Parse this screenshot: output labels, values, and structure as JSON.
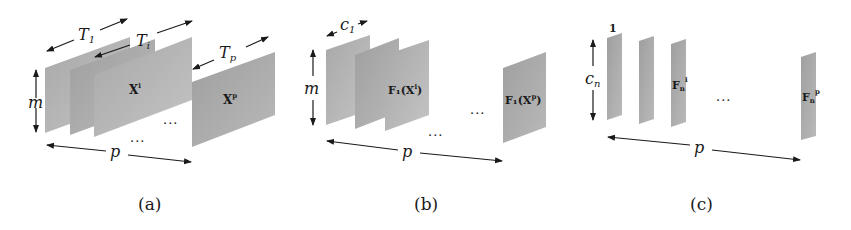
{
  "figure": {
    "panels": [
      {
        "id": "a",
        "caption": "(a)",
        "plates": [
          {
            "label": ""
          },
          {
            "label": ""
          },
          {
            "label": "X",
            "sup": "i"
          },
          {
            "label": "X",
            "sup": "p"
          }
        ],
        "dims": {
          "height": "m",
          "width": "p",
          "widths": [
            {
              "main": "T",
              "sub": "1"
            },
            {
              "main": "T",
              "sub": "i"
            },
            {
              "main": "T",
              "sub": "p"
            }
          ]
        },
        "ellipsis": [
          "...",
          "..."
        ]
      },
      {
        "id": "b",
        "caption": "(b)",
        "plates": [
          {
            "label": ""
          },
          {
            "label": ""
          },
          {
            "label": "F₁(X",
            "sup": "i",
            "close": ")"
          },
          {
            "label": "F₁(X",
            "sup": "p",
            "close": ")"
          }
        ],
        "dims": {
          "height": "m",
          "width": "p",
          "plate_width": {
            "main": "c",
            "sub": "1"
          }
        },
        "ellipsis": [
          "...",
          "..."
        ]
      },
      {
        "id": "c",
        "caption": "(c)",
        "plates": [
          {
            "label": "",
            "top": "1"
          },
          {
            "label": ""
          },
          {
            "label": "F",
            "sub": "n",
            "sup": "i"
          },
          {
            "label": "F",
            "sub": "n",
            "sup": "p"
          }
        ],
        "dims": {
          "height": {
            "main": "c",
            "sub": "n"
          },
          "width": "p"
        },
        "ellipsis": [
          "..."
        ]
      }
    ],
    "colors": {
      "plate_fill": "#a9a9a9",
      "plate_fill_light": "#bdbdbd",
      "arrow": "#1a1a1a",
      "background": "#ffffff"
    }
  }
}
